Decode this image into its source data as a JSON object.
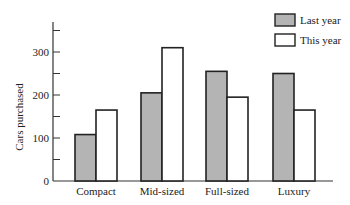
{
  "chart_data": {
    "type": "bar",
    "title": "",
    "xlabel": "",
    "ylabel": "Cars purchased",
    "categories": [
      "Compact",
      "Mid-sized",
      "Full-sized",
      "Luxury"
    ],
    "series": [
      {
        "name": "Last year",
        "values": [
          108,
          205,
          255,
          250
        ],
        "color": "#b4b4b4"
      },
      {
        "name": "This year",
        "values": [
          165,
          310,
          195,
          165
        ],
        "color": "#ffffff"
      }
    ],
    "ylim": [
      0,
      370
    ],
    "yticks": [
      0,
      100,
      200,
      300
    ],
    "ytick_labels": [
      "0",
      "100",
      "200",
      "300"
    ],
    "grid": false,
    "legend_position": "top-right"
  },
  "legend": {
    "items": [
      {
        "label": "Last year",
        "color": "#b4b4b4"
      },
      {
        "label": "This year",
        "color": "#ffffff"
      }
    ]
  }
}
